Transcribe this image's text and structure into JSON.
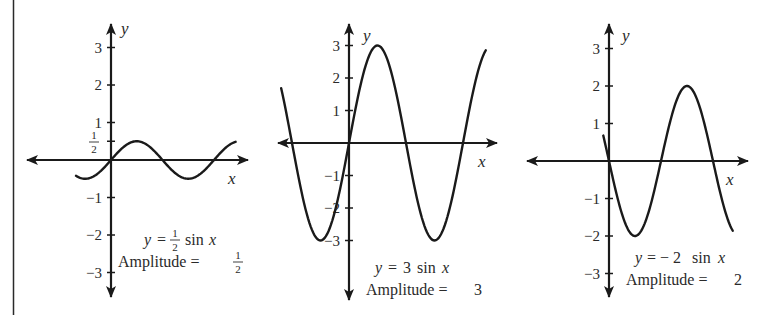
{
  "figure": {
    "border_color": "#2a2a2a",
    "ink_color": "#1a1a1a",
    "background": "#ffffff"
  },
  "chart_data": [
    {
      "type": "line",
      "title": "y = 1/2 sin x",
      "equation": {
        "lhs": "y",
        "eq": "=",
        "coef_num": "1",
        "coef_den": "2",
        "fn": "sin",
        "var": "x"
      },
      "amplitude_caption": {
        "label": "Amplitude =",
        "value_num": "1",
        "value_den": "2"
      },
      "xlabel": "x",
      "ylabel": "y",
      "amplitude": 0.5,
      "coefficient": 0.5,
      "ylim": [
        -3,
        3
      ],
      "yticks": [
        "3",
        "2",
        "1",
        "−1",
        "−2",
        "−3"
      ],
      "ytick_values": [
        3,
        2,
        1,
        -1,
        -2,
        -3
      ],
      "extra_ytick": {
        "value": 0.5,
        "num": "1",
        "den": "2"
      },
      "x_range_halfperiods": [
        -0.68,
        2.42
      ],
      "grid": false,
      "layout": {
        "ox": 111,
        "oy": 160,
        "unit": 37.5,
        "halfperiod_px": 51.5,
        "x_axis": [
          27,
          248
        ],
        "y_axis": [
          24,
          297
        ]
      }
    },
    {
      "type": "line",
      "title": "y = 3 sin x",
      "equation": {
        "lhs": "y",
        "eq": "=",
        "coef": "3",
        "fn": "sin",
        "var": "x"
      },
      "amplitude_caption": {
        "label": "Amplitude =",
        "value": "3"
      },
      "xlabel": "x",
      "ylabel": "y",
      "amplitude": 3,
      "coefficient": 3,
      "ylim": [
        -3,
        3
      ],
      "yticks": [
        "3",
        "2",
        "1",
        "−1",
        "−2",
        "−3"
      ],
      "ytick_values": [
        3,
        2,
        1,
        -1,
        -2,
        -3
      ],
      "x_range_halfperiods": [
        -1.19,
        2.4
      ],
      "grid": false,
      "layout": {
        "ox": 349,
        "oy": 143,
        "unit": 32.5,
        "halfperiod_px": 57,
        "x_axis": [
          278,
          497
        ],
        "y_axis": [
          24,
          300
        ]
      }
    },
    {
      "type": "line",
      "title": "y = −2 sin x",
      "equation": {
        "lhs": "y",
        "eq": "=",
        "coef": "− 2",
        "fn": "sin",
        "var": "x"
      },
      "amplitude_caption": {
        "label": "Amplitude =",
        "value": "2"
      },
      "xlabel": "x",
      "ylabel": "y",
      "amplitude": 2,
      "coefficient": -2,
      "ylim": [
        -3,
        3
      ],
      "yticks": [
        "3",
        "2",
        "1",
        "−1",
        "−2",
        "−3"
      ],
      "ytick_values": [
        3,
        2,
        1,
        -1,
        -2,
        -3
      ],
      "x_range_halfperiods": [
        -0.11,
        2.38
      ],
      "grid": false,
      "layout": {
        "ox": 609,
        "oy": 161,
        "unit": 37.5,
        "halfperiod_px": 52,
        "x_axis": [
          527,
          748
        ],
        "y_axis": [
          24,
          297
        ]
      }
    }
  ]
}
